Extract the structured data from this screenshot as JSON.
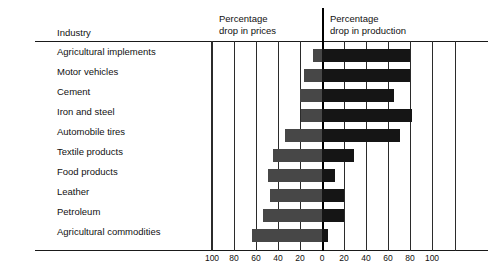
{
  "header": {
    "industry_title": "Industry",
    "prices_title": "Percentage\ndrop in prices",
    "production_title": "Percentage\ndrop in production"
  },
  "chart_data": {
    "type": "bar",
    "orientation": "horizontal",
    "subtype": "diverging-bidirectional",
    "title": "",
    "xlabel": "",
    "ylabel": "Industry",
    "grid": true,
    "legend": "none",
    "axis": {
      "left_label": "Percentage drop in prices",
      "right_label": "Percentage drop in production",
      "tick_labels": [
        "100",
        "80",
        "60",
        "40",
        "20",
        "0",
        "20",
        "40",
        "60",
        "80",
        "100"
      ],
      "tick_values": [
        -100,
        -80,
        -60,
        -40,
        -20,
        0,
        20,
        40,
        60,
        80,
        100
      ],
      "xlim": [
        -100,
        100
      ],
      "zero_at": "0"
    },
    "categories": [
      "Agricultural implements",
      "Motor vehicles",
      "Cement",
      "Iron and steel",
      "Automobile tires",
      "Textile products",
      "Food products",
      "Leather",
      "Petroleum",
      "Agricultural commodities"
    ],
    "series": [
      {
        "name": "Percentage drop in prices",
        "color": "#474747",
        "direction": "left",
        "values": [
          8,
          16,
          20,
          19,
          34,
          45,
          49,
          47,
          54,
          64
        ]
      },
      {
        "name": "Percentage drop in production",
        "color": "#151515",
        "direction": "right",
        "values": [
          80,
          80,
          65,
          82,
          71,
          29,
          12,
          20,
          20,
          5
        ]
      }
    ]
  }
}
